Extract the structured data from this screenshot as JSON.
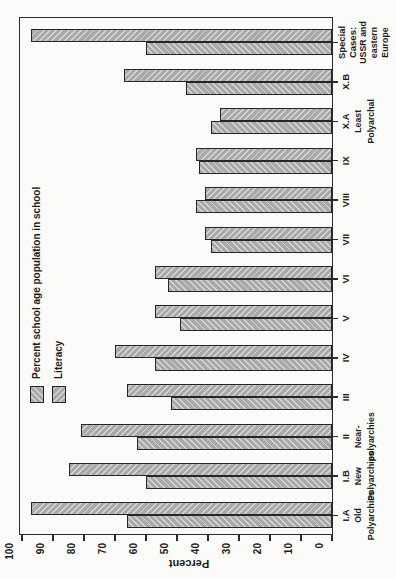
{
  "colors": {
    "paper": "#fbfbf9",
    "ink": "#1b1b1b",
    "bar_gray": "#a9a9a9",
    "hatch_light": "#d6d6d6"
  },
  "chart_data": {
    "type": "bar",
    "title": "",
    "orientation": "vertical grouped bar chart printed rotated 90 degrees counterclockwise on the page",
    "percent_axis": {
      "label": "Percent",
      "min": 0,
      "max": 100,
      "tick_step": 10,
      "tick_labels": [
        "100",
        "90",
        "80",
        "70",
        "60",
        "50",
        "40",
        "30",
        "20",
        "10",
        "0"
      ]
    },
    "categories": [
      {
        "code": "I.A",
        "group_lines": [
          "Old",
          "Polyarchies"
        ]
      },
      {
        "code": "I.B",
        "group_lines": [
          "New",
          "Polyarchies"
        ]
      },
      {
        "code": "II",
        "group_lines": [
          "Near-",
          "polyarchies"
        ]
      },
      {
        "code": "III",
        "group_lines": []
      },
      {
        "code": "IV",
        "group_lines": []
      },
      {
        "code": "V",
        "group_lines": []
      },
      {
        "code": "VI",
        "group_lines": []
      },
      {
        "code": "VII",
        "group_lines": []
      },
      {
        "code": "VIII",
        "group_lines": []
      },
      {
        "code": "IX",
        "group_lines": []
      },
      {
        "code": "X.A",
        "group_lines": [
          "Least",
          "Polyarchal"
        ]
      },
      {
        "code": "X.B",
        "group_lines": []
      },
      {
        "code_lines": [
          "Special",
          "Cases:"
        ],
        "group_lines": [
          "USSR and",
          "eastern",
          "Europe"
        ]
      }
    ],
    "series": [
      {
        "name": "Percent school age population in school",
        "hatch": "backslash-on-page",
        "values": [
          66,
          60,
          63,
          52,
          57,
          49,
          53,
          39,
          44,
          43,
          39,
          47,
          60
        ]
      },
      {
        "name": "Literacy",
        "hatch": "slash-on-page",
        "values": [
          97,
          85,
          81,
          66,
          70,
          57,
          57,
          41,
          41,
          44,
          36,
          67,
          97
        ]
      }
    ],
    "legend": {
      "position": "inside-plot-near-axis",
      "items": [
        "Percent school age population in school",
        "Literacy"
      ]
    },
    "grid": false
  }
}
